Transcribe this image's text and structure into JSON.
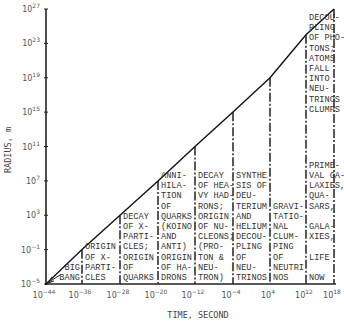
{
  "chart_data": {
    "type": "line",
    "title": "",
    "xlabel": "TIME, SECOND",
    "ylabel": "RADIUS, m",
    "xscale": "log",
    "yscale": "log",
    "x_tick_exponents": [
      -44,
      -36,
      -28,
      -20,
      -12,
      -4,
      4,
      12,
      18
    ],
    "y_tick_exponents": [
      -5,
      -1,
      3,
      7,
      11,
      15,
      19,
      23,
      27
    ],
    "x_ticks": [
      "10^-44",
      "10^-36",
      "10^-28",
      "10^-20",
      "10^-12",
      "10^-4",
      "10^4",
      "10^12",
      "10^18"
    ],
    "y_ticks": [
      "10^-5",
      "10^-1",
      "10^3",
      "10^7",
      "10^11",
      "10^15",
      "10^19",
      "10^23",
      "10^27"
    ],
    "xlim_exp": [
      -44,
      18
    ],
    "ylim_exp": [
      -5,
      27
    ],
    "grid": false,
    "legend": null,
    "series": [
      {
        "name": "radius of universe",
        "points_log10": [
          [
            -44,
            -5
          ],
          [
            -36,
            -1
          ],
          [
            -28,
            3
          ],
          [
            -20,
            7
          ],
          [
            -12,
            11
          ],
          [
            -4,
            15
          ],
          [
            4,
            19
          ],
          [
            12,
            24
          ],
          [
            18,
            27
          ]
        ]
      }
    ],
    "eras": [
      {
        "x_from": -44,
        "x_to": -36,
        "lines": [
          "BIG",
          "BANG"
        ],
        "arrow": true
      },
      {
        "x_from": -36,
        "x_to": -28,
        "lines": [
          "ORIGIN",
          "OF X-",
          "PARTI-",
          "CLES"
        ]
      },
      {
        "x_from": -28,
        "x_to": -20,
        "lines": [
          "DECAY",
          "OF X-",
          "PARTI-",
          "CLES;",
          "ORIGIN",
          "OF",
          "QUARKS"
        ]
      },
      {
        "x_from": -20,
        "x_to": -12,
        "lines": [
          "ANNI-",
          "HILA-",
          "TION",
          "OF",
          "QUARKS",
          "(KOINO",
          "AND",
          "ANTI)",
          "ORIGIN",
          "OF HA-",
          "DRONS"
        ]
      },
      {
        "x_from": -12,
        "x_to": -4,
        "lines": [
          "DECAY",
          "OF HEA-",
          "VY HAD-",
          "RONS;",
          "ORIGIN",
          "OF NU-",
          "CLEONS;",
          "(PRO-",
          "TON &",
          "NEU-",
          "TRON)"
        ]
      },
      {
        "x_from": -4,
        "x_to": 4,
        "lines": [
          "SYNTHE",
          "SIS OF",
          "DEU-",
          "TERIUM",
          "AND",
          "HELIUM",
          "DECOU-",
          "PLING",
          "OF",
          "NEU-",
          "TRINOS"
        ]
      },
      {
        "x_from": 4,
        "x_to": 12,
        "lines": [
          "GRAVI-",
          "TATIO-",
          "NAL",
          "CLUM-",
          "PING",
          "OF",
          "NEUTRI",
          "NOS"
        ]
      },
      {
        "x_from": 12,
        "x_to": 18,
        "lines": [
          "DECOU-",
          "PLING",
          "OF PHO-",
          "TONS;",
          "ATOMS",
          "FALL",
          "INTO",
          "NEU-",
          "TRINOS",
          "CLUMPS"
        ],
        "lines2": [
          "PRIME-",
          "VAL GA-",
          "LAXIES,",
          "QUA-",
          "SARS,",
          "",
          "GALA-",
          "XIES,",
          "",
          "LIFE",
          "",
          "NOW"
        ]
      }
    ]
  },
  "labels": {
    "xlabel": "TIME, SECOND",
    "ylabel": "RADIUS, m"
  }
}
